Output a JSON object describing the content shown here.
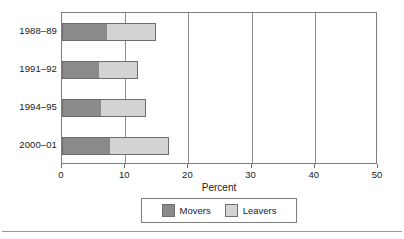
{
  "chart_data": {
    "type": "bar",
    "orientation": "horizontal",
    "stacked": true,
    "title": "",
    "xlabel": "Percent",
    "ylabel": "",
    "xlim": [
      0,
      50
    ],
    "xticks": [
      0,
      10,
      20,
      30,
      40,
      50
    ],
    "grid": true,
    "grid_axis": "x",
    "legend_position": "bottom",
    "categories": [
      "1988–89",
      "1991–92",
      "1994–95",
      "2000–01"
    ],
    "series": [
      {
        "name": "Movers",
        "color": "#8a8a8a",
        "values": [
          7.1,
          5.9,
          6.2,
          7.6
        ]
      },
      {
        "name": "Leavers",
        "color": "#d3d3d3",
        "values": [
          7.7,
          6.2,
          7.1,
          9.4
        ]
      }
    ],
    "totals": [
      14.8,
      12.1,
      13.3,
      17.0
    ]
  },
  "axis": {
    "tick_labels": [
      "0",
      "10",
      "20",
      "30",
      "40",
      "50"
    ],
    "x_title": "Percent"
  },
  "legend": {
    "entries": [
      {
        "label": "Movers",
        "color": "#8a8a8a"
      },
      {
        "label": "Leavers",
        "color": "#d3d3d3"
      }
    ]
  },
  "colors": {
    "movers": "#8a8a8a",
    "leavers": "#d3d3d3",
    "frame": "#7d7d7d",
    "gridline": "#8c8c8c",
    "text": "#1a1a1a",
    "background": "#ffffff"
  }
}
